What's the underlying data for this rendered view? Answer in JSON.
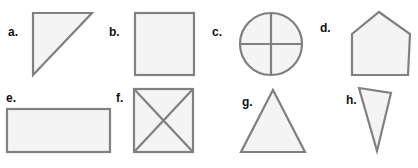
{
  "worksheet": {
    "width": 418,
    "height": 168,
    "background_color": "#ffffff",
    "stroke_color": "#808080",
    "fill_color": "#f4f4f4",
    "label_color": "#111111"
  },
  "shapes": [
    {
      "label": "a.",
      "name": "right-triangle",
      "label_x": 8,
      "label_y": 26,
      "box_x": 30,
      "box_y": 10,
      "box_w": 68,
      "box_h": 70,
      "geometry": "triangle right angle top-left, legs vertical and horizontal, hypotenuse from bottom-left to top-right"
    },
    {
      "label": "b.",
      "name": "square",
      "label_x": 109,
      "label_y": 26,
      "box_x": 132,
      "box_y": 10,
      "box_w": 66,
      "box_h": 70,
      "geometry": "square"
    },
    {
      "label": "c.",
      "name": "circle-with-cross",
      "label_x": 212,
      "label_y": 26,
      "box_x": 236,
      "box_y": 8,
      "box_w": 70,
      "box_h": 72,
      "geometry": "circle divided into four quarters by a vertical and a horizontal diameter"
    },
    {
      "label": "d.",
      "name": "pentagon",
      "label_x": 320,
      "label_y": 22,
      "box_x": 344,
      "box_y": 8,
      "box_w": 70,
      "box_h": 72,
      "geometry": "house-shaped pentagon, peak at top center"
    },
    {
      "label": "e.",
      "name": "rectangle",
      "label_x": 6,
      "label_y": 92,
      "box_x": 4,
      "box_y": 106,
      "box_w": 110,
      "box_h": 50,
      "geometry": "wide rectangle"
    },
    {
      "label": "f.",
      "name": "square-with-diagonals",
      "label_x": 116,
      "label_y": 92,
      "box_x": 130,
      "box_y": 86,
      "box_w": 68,
      "box_h": 70,
      "geometry": "square with both diagonals drawn forming an X"
    },
    {
      "label": "g.",
      "name": "equilateral-triangle",
      "label_x": 242,
      "label_y": 96,
      "box_x": 234,
      "box_y": 86,
      "box_w": 78,
      "box_h": 70,
      "geometry": "upright isosceles triangle"
    },
    {
      "label": "h.",
      "name": "narrow-triangle",
      "label_x": 346,
      "label_y": 94,
      "box_x": 352,
      "box_y": 84,
      "box_w": 48,
      "box_h": 72,
      "geometry": "narrow scalene triangle pointing downward"
    }
  ]
}
